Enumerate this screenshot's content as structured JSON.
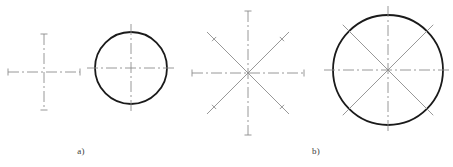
{
  "figure": {
    "background_color": "#ffffff",
    "width": 453,
    "height": 167,
    "captions": [
      {
        "label": "a)",
        "x": 81,
        "y": 146
      },
      {
        "label": "b)",
        "x": 316,
        "y": 146
      }
    ],
    "colors": {
      "object_line": "#1a1a1a",
      "center_line": "#8c8c8c",
      "diagonal_line": "#8c8c8c",
      "caption_text": "#3a3a3a"
    },
    "stroke_widths": {
      "object_line": 1.8,
      "center_line": 0.9,
      "diagonal_line": 0.9,
      "tick_mark": 0.9
    },
    "dash_patterns": {
      "center_line": "11 3 2 3"
    },
    "panels": [
      {
        "name": "panel-a",
        "caption": "a)",
        "items": [
          {
            "name": "crosshair-centerline",
            "type": "crosshair",
            "cx": 44,
            "cy": 72,
            "half_width": 36,
            "half_height": 38,
            "ray_count": 4,
            "has_circle": false,
            "end_ticks": true
          },
          {
            "name": "small-circle-with-crosshair",
            "type": "circle-with-centerlines",
            "cx": 131,
            "cy": 68,
            "radius": 36,
            "ray_count": 4,
            "overhang": 8,
            "has_circle": true,
            "end_ticks": false
          }
        ]
      },
      {
        "name": "panel-b",
        "caption": "b)",
        "items": [
          {
            "name": "eight-ray-star",
            "type": "star",
            "cx": 248,
            "cy": 73,
            "half_width": 56,
            "half_height": 62,
            "diagonal_reach": 58,
            "ray_count": 8,
            "has_circle": false,
            "end_ticks": true
          },
          {
            "name": "large-circle-with-eight-rays",
            "type": "circle-with-centerlines",
            "cx": 388,
            "cy": 70,
            "radius": 55,
            "ray_count": 8,
            "overhang": 9,
            "has_circle": true,
            "end_ticks": false
          }
        ]
      }
    ]
  }
}
